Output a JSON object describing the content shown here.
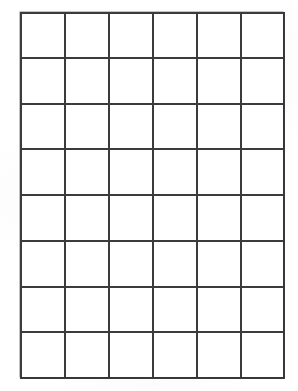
{
  "document": {
    "type": "blank-grid-worksheet",
    "background_color": "#ffffff",
    "line_color": "#3b3b3b",
    "line_width_px": 2,
    "cell_text": ""
  },
  "grid": {
    "columns": 6,
    "rows": 8,
    "total_cells": 48,
    "origin_x_px": 20,
    "origin_y_px": 12,
    "width_px": 263,
    "height_px": 365,
    "cell_width_px": 43.8,
    "cell_height_px": 45.6,
    "column_line_x_px": [
      20,
      64,
      108,
      152,
      196,
      240,
      283
    ],
    "row_line_y_px": [
      12,
      57,
      103,
      148,
      194,
      240,
      286,
      331,
      377
    ],
    "cells": [
      [
        "",
        "",
        "",
        "",
        "",
        ""
      ],
      [
        "",
        "",
        "",
        "",
        "",
        ""
      ],
      [
        "",
        "",
        "",
        "",
        "",
        ""
      ],
      [
        "",
        "",
        "",
        "",
        "",
        ""
      ],
      [
        "",
        "",
        "",
        "",
        "",
        ""
      ],
      [
        "",
        "",
        "",
        "",
        "",
        ""
      ],
      [
        "",
        "",
        "",
        "",
        "",
        ""
      ],
      [
        "",
        "",
        "",
        "",
        "",
        ""
      ]
    ]
  }
}
